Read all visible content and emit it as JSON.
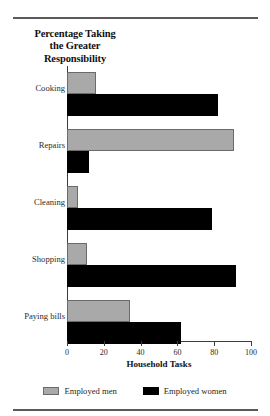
{
  "chart_data": {
    "type": "bar",
    "orientation": "horizontal",
    "title": "Percentage Taking the Greater Responsibility",
    "title_lines": [
      "Percentage Taking",
      "the Greater",
      "Responsibility"
    ],
    "xlabel": "Household Tasks",
    "ylabel": "",
    "categories": [
      "Cooking",
      "Repairs",
      "Cleaning",
      "Shopping",
      "Paying bills"
    ],
    "series": [
      {
        "name": "Employed men",
        "color": "#a9a9a9",
        "values": [
          16,
          91,
          6,
          11,
          34
        ]
      },
      {
        "name": "Employed women",
        "color": "#000000",
        "values": [
          82,
          12,
          79,
          92,
          62
        ]
      }
    ],
    "xlim": [
      0,
      100
    ],
    "xticks": [
      0,
      20,
      40,
      60,
      80,
      100
    ],
    "xtick_labels": [
      "0",
      "20",
      "40",
      "60",
      "80",
      "100"
    ],
    "grid": false,
    "legend_position": "bottom"
  },
  "legend": {
    "items": [
      {
        "label": "Employed men",
        "swatch": "gray-swatch"
      },
      {
        "label": "Employed women",
        "swatch": "black-swatch"
      }
    ]
  }
}
